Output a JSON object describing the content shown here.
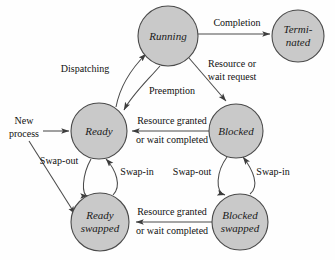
{
  "diagram": {
    "background_color": "#fefefe",
    "node_fill_color": "#c9c9c9",
    "node_stroke_color": "#4a4a4a",
    "edge_color": "#4a4a4a",
    "text_color": "#101010",
    "nodes": [
      {
        "id": "running",
        "label": "Running",
        "label2": "",
        "cx": 168,
        "cy": 36,
        "r": 30
      },
      {
        "id": "terminated",
        "label": "Termi-",
        "label2": "nated",
        "cx": 298,
        "cy": 36,
        "r": 26
      },
      {
        "id": "ready",
        "label": "Ready",
        "label2": "",
        "cx": 99,
        "cy": 131,
        "r": 28
      },
      {
        "id": "blocked",
        "label": "Blocked",
        "label2": "",
        "cx": 236,
        "cy": 131,
        "r": 27
      },
      {
        "id": "ready-swapped",
        "label": "Ready",
        "label2": "swapped",
        "cx": 100,
        "cy": 222,
        "r": 29
      },
      {
        "id": "blocked-swapped",
        "label": "Blocked",
        "label2": "swapped",
        "cx": 240,
        "cy": 222,
        "r": 28
      }
    ],
    "edges": [
      {
        "id": "new-process-to-ready",
        "label": "New",
        "label2": "process"
      },
      {
        "id": "new-process-to-ready-swapped",
        "label": "",
        "label2": ""
      },
      {
        "id": "running-to-terminated",
        "label": "Completion",
        "label2": ""
      },
      {
        "id": "running-to-blocked",
        "label": "Resource or",
        "label2": "wait request"
      },
      {
        "id": "ready-to-running",
        "label": "Dispatching",
        "label2": ""
      },
      {
        "id": "running-to-ready",
        "label": "Preemption",
        "label2": ""
      },
      {
        "id": "blocked-to-ready",
        "label": "Resource granted",
        "label2": "or wait completed"
      },
      {
        "id": "ready-to-ready-swapped",
        "label": "Swap-out",
        "label2": ""
      },
      {
        "id": "ready-swapped-to-ready",
        "label": "Swap-in",
        "label2": ""
      },
      {
        "id": "blocked-to-blocked-swapped",
        "label": "Swap-out",
        "label2": ""
      },
      {
        "id": "blocked-swapped-to-blocked",
        "label": "Swap-in",
        "label2": ""
      },
      {
        "id": "blocked-swapped-to-ready-swapped",
        "label": "Resource granted",
        "label2": "or wait completed"
      }
    ],
    "labels": {
      "completion": "Completion",
      "resource_or": "Resource or",
      "wait_request": "wait request",
      "dispatching": "Dispatching",
      "preemption": "Preemption",
      "new": "New",
      "process": "process",
      "resource_granted_mid": "Resource granted",
      "or_wait_completed_mid": "or wait completed",
      "swap_out_left": "Swap-out",
      "swap_in_left": "Swap-in",
      "swap_out_right": "Swap-out",
      "swap_in_right": "Swap-in",
      "resource_granted_bottom": "Resource granted",
      "or_wait_completed_bottom": "or wait completed"
    }
  }
}
